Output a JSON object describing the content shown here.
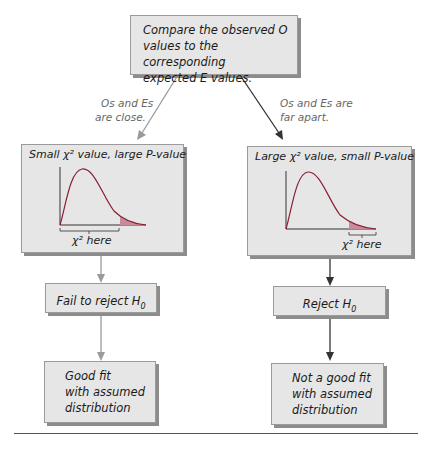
{
  "top_box": {
    "lines": [
      "Compare the observed O",
      "values to the corresponding",
      "expected E values."
    ]
  },
  "left_branch": {
    "edge_label": [
      "Os and Es",
      "are close."
    ],
    "panel_title": "Small χ² value, large P-value",
    "axis_note": "χ² here",
    "decision": "Fail to reject H",
    "decision_sub": "0",
    "conclusion": [
      "Good fit",
      "with assumed",
      "distribution"
    ]
  },
  "right_branch": {
    "edge_label": [
      "Os and Es are",
      "far apart."
    ],
    "panel_title": "Large χ² value, small P-value",
    "axis_note": "χ² here",
    "decision": "Reject H",
    "decision_sub": "0",
    "conclusion": [
      "Not a good fit",
      "with assumed",
      "distribution"
    ]
  },
  "colors": {
    "box_fill": "#e6e6e6",
    "box_shadow": "#8c8c8c",
    "curve": "#c0304a",
    "tail_fill": "#c88c98",
    "left_arrow": "#9a9a9a",
    "right_arrow": "#333333"
  }
}
